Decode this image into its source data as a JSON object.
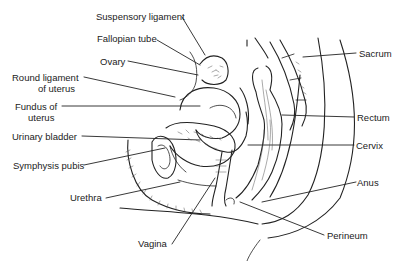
{
  "diagram": {
    "type": "anatomical-cross-section",
    "labels_left": [
      {
        "text": "Suspensory ligament",
        "x": 96,
        "y": 11
      },
      {
        "text": "Fallopian tube",
        "x": 97,
        "y": 33
      },
      {
        "text": "Ovary",
        "x": 100,
        "y": 56
      },
      {
        "text": "Round ligament",
        "x": 12,
        "y": 72
      },
      {
        "text": "of uterus",
        "x": 38,
        "y": 83
      },
      {
        "text": "Fundus of",
        "x": 15,
        "y": 101
      },
      {
        "text": "uterus",
        "x": 28,
        "y": 112
      },
      {
        "text": "Urinary bladder",
        "x": 12,
        "y": 131
      },
      {
        "text": "Symphysis pubis",
        "x": 13,
        "y": 160
      },
      {
        "text": "Urethra",
        "x": 70,
        "y": 192
      },
      {
        "text": "Vagina",
        "x": 138,
        "y": 238
      }
    ],
    "labels_right": [
      {
        "text": "Sacrum",
        "x": 359,
        "y": 48
      },
      {
        "text": "Rectum",
        "x": 357,
        "y": 112
      },
      {
        "text": "Cervix",
        "x": 356,
        "y": 140
      },
      {
        "text": "Anus",
        "x": 357,
        "y": 177
      },
      {
        "text": "Perineum",
        "x": 327,
        "y": 230
      }
    ],
    "line_color": "#222222",
    "background": "#ffffff"
  }
}
